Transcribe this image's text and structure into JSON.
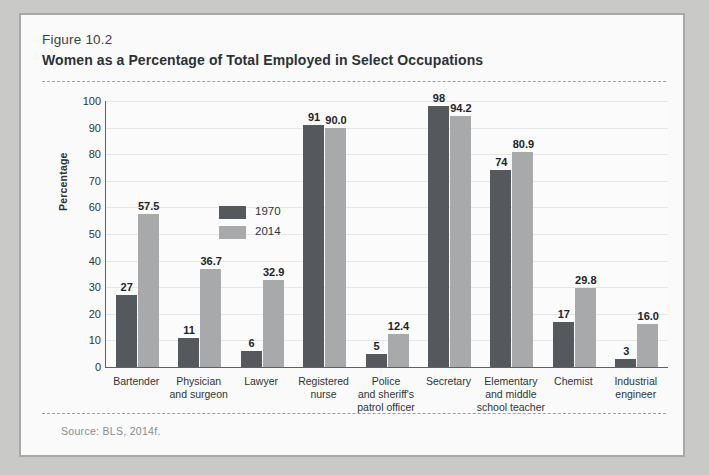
{
  "figure": {
    "number": "Figure 10.2",
    "title": "Women as a Percentage of Total Employed in Select Occupations",
    "source": "Source:  BLS, 2014f."
  },
  "colors": {
    "series_1970": "#55595d",
    "series_2014": "#a7a9ab",
    "panel_background": "#fafafa",
    "page_background": "#c9c9c7",
    "axis": "#5c6166",
    "gridline": "#e6e6e6"
  },
  "chart_data": {
    "type": "bar",
    "title": "Women as a Percentage of Total Employed in Select Occupations",
    "xlabel": "",
    "ylabel": "Percentage",
    "ylim": [
      0,
      100
    ],
    "ytick_step": 10,
    "yticks": [
      "0",
      "10",
      "20",
      "30",
      "40",
      "50",
      "60",
      "70",
      "80",
      "90",
      "100"
    ],
    "grid": true,
    "legend_position": "upper-left-inside",
    "categories": [
      "Bartender",
      "Physician and surgeon",
      "Lawyer",
      "Registered nurse",
      "Police and sheriff's patrol officer",
      "Secretary",
      "Elementary and middle school teacher",
      "Chemist",
      "Industrial engineer"
    ],
    "category_lines": [
      [
        "Bartender"
      ],
      [
        "Physician",
        "and surgeon"
      ],
      [
        "Lawyer"
      ],
      [
        "Registered",
        "nurse"
      ],
      [
        "Police",
        "and sheriff's",
        "patrol officer"
      ],
      [
        "Secretary"
      ],
      [
        "Elementary",
        "and middle",
        "school teacher"
      ],
      [
        "Chemist"
      ],
      [
        "Industrial",
        "engineer"
      ]
    ],
    "series": [
      {
        "name": "1970",
        "color": "#55595d",
        "values": [
          27,
          11,
          6,
          91,
          5,
          98,
          74,
          17,
          3
        ],
        "labels": [
          "27",
          "11",
          "6",
          "91",
          "5",
          "98",
          "74",
          "17",
          "3"
        ]
      },
      {
        "name": "2014",
        "color": "#a7a9ab",
        "values": [
          57.5,
          36.7,
          32.9,
          90.0,
          12.4,
          94.2,
          80.9,
          29.8,
          16.0
        ],
        "labels": [
          "57.5",
          "36.7",
          "32.9",
          "90.0",
          "12.4",
          "94.2",
          "80.9",
          "29.8",
          "16.0"
        ]
      }
    ]
  }
}
